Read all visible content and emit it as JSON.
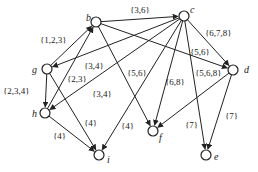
{
  "nodes": [
    {
      "id": "b",
      "x": 96,
      "y": 22,
      "lx": 86,
      "ly": 21
    },
    {
      "id": "c",
      "x": 184,
      "y": 16,
      "lx": 190,
      "ly": 13
    },
    {
      "id": "d",
      "x": 233,
      "y": 70,
      "lx": 244,
      "ly": 73
    },
    {
      "id": "g",
      "x": 47,
      "y": 69,
      "lx": 32,
      "ly": 73
    },
    {
      "id": "h",
      "x": 45,
      "y": 113,
      "lx": 32,
      "ly": 117
    },
    {
      "id": "i",
      "x": 99,
      "y": 155,
      "lx": 107,
      "ly": 163
    },
    {
      "id": "f",
      "x": 153,
      "y": 131,
      "lx": 159,
      "ly": 141
    },
    {
      "id": "e",
      "x": 206,
      "y": 155,
      "lx": 214,
      "ly": 160
    }
  ],
  "edges": [
    {
      "from": "b",
      "to": "c",
      "label": "{3,6}",
      "lx": 130,
      "ly": 13
    },
    {
      "from": "g",
      "to": "b",
      "label": "{1,2,3}",
      "lx": 40,
      "ly": 43
    },
    {
      "from": "c",
      "to": "g",
      "label": "{3,4}",
      "lx": 84,
      "ly": 69
    },
    {
      "from": "g",
      "to": "h",
      "label": "{2,3,4}",
      "lx": 3,
      "ly": 94
    },
    {
      "from": "h",
      "to": "b",
      "label": "{2,3}",
      "lx": 67,
      "ly": 82
    },
    {
      "from": "c",
      "to": "h",
      "label": "{3,4}",
      "lx": 92,
      "ly": 97
    },
    {
      "from": "h",
      "to": "i",
      "label": "{4}",
      "lx": 53,
      "ly": 139
    },
    {
      "from": "g",
      "to": "i",
      "label": "{4}",
      "lx": 84,
      "ly": 126
    },
    {
      "from": "c",
      "to": "i",
      "label": "{4}",
      "lx": 121,
      "ly": 129
    },
    {
      "from": "b",
      "to": "f",
      "label": "{5,6}",
      "lx": 127,
      "ly": 76
    },
    {
      "from": "c",
      "to": "f",
      "label": "{6,8}",
      "lx": 165,
      "ly": 85
    },
    {
      "from": "d",
      "to": "f",
      "label": "{5,6,8}",
      "lx": 195,
      "ly": 76
    },
    {
      "from": "c",
      "to": "d",
      "label": "{6,7,8}",
      "lx": 205,
      "ly": 36
    },
    {
      "from": "b",
      "to": "d",
      "label": "{5,6}",
      "lx": 190,
      "ly": 55
    },
    {
      "from": "c",
      "to": "e",
      "label": "{7}",
      "lx": 185,
      "ly": 128
    },
    {
      "from": "d",
      "to": "e",
      "label": "{7}",
      "lx": 225,
      "ly": 119
    }
  ]
}
